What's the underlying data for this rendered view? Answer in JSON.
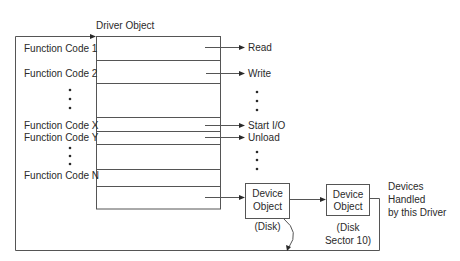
{
  "diagram": {
    "driver_object": {
      "title": "Driver Object",
      "rows": [
        {
          "label": "Function Code 1",
          "target": "Read"
        },
        {
          "label": "Function Code 2",
          "target": "Write"
        },
        {
          "label": "",
          "target": ""
        },
        {
          "label": "Function Code X",
          "target": "Start I/O"
        },
        {
          "label": "Function Code Y",
          "target": "Unload"
        },
        {
          "label": "",
          "target": ""
        },
        {
          "label": "Function Code N",
          "target": ""
        },
        {
          "label": "",
          "target": "Device Object"
        }
      ]
    },
    "device_objects": [
      {
        "line1": "Device",
        "line2": "Object",
        "caption1": "(Disk)",
        "caption2": ""
      },
      {
        "line1": "Device",
        "line2": "Object",
        "caption1": "(Disk",
        "caption2": "Sector 10)"
      }
    ],
    "devices_note": [
      "Devices",
      "Handled",
      "by this Driver"
    ],
    "colors": {
      "line": "#555555",
      "text": "#2a2a2a",
      "background": "#ffffff"
    }
  }
}
